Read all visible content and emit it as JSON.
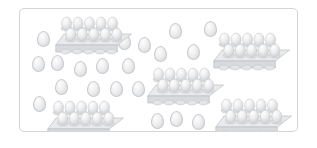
{
  "scene": {
    "title": "Eggs and egg cartons grouping illustration",
    "description": "Five ten-egg cartons and twenty-two loose eggs scattered inside a rounded rectangular frame",
    "background_color": "#ffffff",
    "frame": {
      "border_color": "#d3d5d8",
      "fill_color": "#ffffff",
      "corner_radius": "5px",
      "x": 19,
      "y": 8,
      "width": 279,
      "height": 124
    },
    "palette": {
      "egg_highlight": "#fdfdfd",
      "egg_mid": "#f0f0f1",
      "egg_shadow": "#cfd1d4",
      "egg_outline": "#c8cacd",
      "carton_top": "#e9eaec",
      "carton_side": "#d8dadd",
      "carton_outline": "#bdbfc3"
    },
    "counts": {
      "cartons": 5,
      "eggs_per_carton": 10,
      "eggs_in_cartons": 50,
      "loose_eggs": 22,
      "total_eggs": 72
    },
    "cartons": [
      {
        "name": "carton-top-left",
        "x": 56,
        "y": 11,
        "rows": 2,
        "columns": 5,
        "eggs": 10
      },
      {
        "name": "carton-top-right",
        "x": 214,
        "y": 27,
        "rows": 2,
        "columns": 5,
        "eggs": 10
      },
      {
        "name": "carton-middle",
        "x": 148,
        "y": 62,
        "rows": 2,
        "columns": 5,
        "eggs": 10
      },
      {
        "name": "carton-bottom-left",
        "x": 48,
        "y": 95,
        "rows": 2,
        "columns": 5,
        "eggs": 10
      },
      {
        "name": "carton-bottom-right",
        "x": 216,
        "y": 93,
        "rows": 2,
        "columns": 5,
        "eggs": 10
      }
    ],
    "loose_eggs": [
      {
        "x": 36,
        "y": 30,
        "w": 11,
        "h": 14
      },
      {
        "x": 31,
        "y": 55,
        "w": 11,
        "h": 14
      },
      {
        "x": 50,
        "y": 54,
        "w": 11,
        "h": 14
      },
      {
        "x": 73,
        "y": 60,
        "w": 11,
        "h": 14
      },
      {
        "x": 95,
        "y": 57,
        "w": 11,
        "h": 14
      },
      {
        "x": 121,
        "y": 57,
        "w": 11,
        "h": 14
      },
      {
        "x": 54,
        "y": 78,
        "w": 11,
        "h": 14
      },
      {
        "x": 86,
        "y": 80,
        "w": 11,
        "h": 14
      },
      {
        "x": 109,
        "y": 80,
        "w": 11,
        "h": 14
      },
      {
        "x": 131,
        "y": 80,
        "w": 11,
        "h": 14
      },
      {
        "x": 32,
        "y": 95,
        "w": 11,
        "h": 14
      },
      {
        "x": 168,
        "y": 22,
        "w": 11,
        "h": 14
      },
      {
        "x": 203,
        "y": 20,
        "w": 11,
        "h": 14
      },
      {
        "x": 153,
        "y": 45,
        "w": 11,
        "h": 14
      },
      {
        "x": 186,
        "y": 43,
        "w": 11,
        "h": 14
      },
      {
        "x": 150,
        "y": 112,
        "w": 11,
        "h": 14
      },
      {
        "x": 169,
        "y": 110,
        "w": 11,
        "h": 14
      },
      {
        "x": 191,
        "y": 113,
        "w": 11,
        "h": 14
      },
      {
        "x": 98,
        "y": 35,
        "w": 11,
        "h": 14
      },
      {
        "x": 117,
        "y": 33,
        "w": 11,
        "h": 14
      },
      {
        "x": 137,
        "y": 36,
        "w": 11,
        "h": 14
      },
      {
        "x": 72,
        "y": 36,
        "w": 11,
        "h": 14
      }
    ]
  }
}
